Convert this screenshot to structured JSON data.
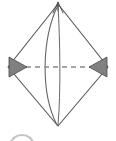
{
  "figure": {
    "type": "geometric-diagram",
    "canvas": {
      "width": 116,
      "height": 141,
      "background": "#ffffff"
    },
    "colors": {
      "outline": "#555555",
      "arc": "#666666",
      "dashed_axis": "#8a8a8a",
      "arrowhead_fill": "#808080",
      "arrowhead_stroke": "#4a4a4a",
      "faint_circle": "#b0b0b0"
    },
    "vertices": {
      "top": {
        "label": "top-vertex",
        "x": 58,
        "y": 4
      },
      "right": {
        "label": "right-vertex",
        "x": 108,
        "y": 67
      },
      "bottom": {
        "label": "bottom-vertex",
        "x": 58,
        "y": 126
      },
      "left": {
        "label": "left-vertex",
        "x": 8,
        "y": 67
      }
    },
    "rhombus": {
      "name": "rhombus-outline",
      "points": "58,4 108,67 58,126 8,67",
      "stroke_width": 1.1
    },
    "arcs": [
      {
        "name": "lens-arc-left",
        "path": "M 58 5 C 42 38, 40 92, 57 125",
        "stroke_width": 1.1
      },
      {
        "name": "lens-arc-right",
        "path": "M 58 5 C 60 40, 61 92, 58 125",
        "stroke_width": 1.0
      }
    ],
    "dashed_axis": {
      "name": "horizontal-dashed-axis",
      "x1": 17,
      "y1": 67,
      "x2": 99,
      "y2": 67,
      "dash_pattern": "5 4",
      "stroke_width": 1.4
    },
    "arrowheads": [
      {
        "name": "left-arrowhead",
        "direction": "right",
        "points": "9,57 27,67 9,77"
      },
      {
        "name": "right-arrowhead",
        "direction": "left",
        "points": "107,57 89,67 107,77"
      }
    ],
    "top_arrow_marker": {
      "name": "top-vertex-arrow-marker",
      "points": "58,2 53,13 58,9 63,13",
      "stroke_width": 0.9
    },
    "faint_circle": {
      "name": "partial-circle-lower-left",
      "cx": 22,
      "cy": 144,
      "rx": 11,
      "ry": 9,
      "stroke_width": 2.2
    }
  }
}
